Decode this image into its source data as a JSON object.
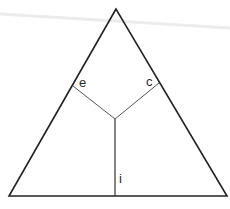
{
  "diagram": {
    "type": "triangle-partition",
    "colors": {
      "background": "#ffffff",
      "outline": "#222222",
      "inner_lines": "#555555",
      "artifact": "#e6e6e6"
    },
    "vertices": {
      "apex": [
        116,
        9
      ],
      "bottom_left": [
        9,
        196
      ],
      "bottom_right": [
        227,
        196
      ]
    },
    "junction": [
      115,
      119
    ],
    "segments": [
      {
        "id": "e",
        "from": [
          115,
          119
        ],
        "to": [
          73,
          86
        ]
      },
      {
        "id": "c",
        "from": [
          115,
          119
        ],
        "to": [
          159,
          83
        ]
      },
      {
        "id": "i",
        "from": [
          115,
          119
        ],
        "to": [
          115,
          196
        ]
      }
    ],
    "labels": {
      "e": "e",
      "c": "c",
      "i": "i"
    }
  }
}
